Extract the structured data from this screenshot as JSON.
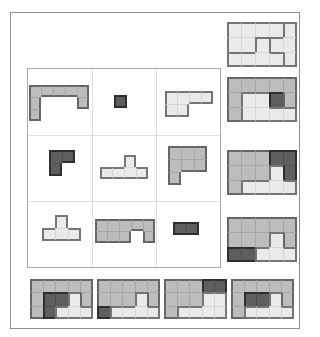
{
  "colors": {
    "page_bg": "#ffffff",
    "frame_border": "#8f8f8f",
    "grid_border": "#aaaaaa",
    "grid_line": "#dedede",
    "piece_colors": {
      "medium": {
        "fill": "#bdbdbd",
        "line": "#a6a6a6",
        "edge": "#666666"
      },
      "light": {
        "fill": "#eaeaea",
        "line": "#d5d5d5",
        "edge": "#757575"
      },
      "dark": {
        "fill": "#5e5e5e",
        "line": "#4e4e4e",
        "edge": "#2e2e2e"
      }
    }
  },
  "frame": {
    "x": 10,
    "y": 12,
    "w": 288,
    "h": 315
  },
  "pieces_grid": {
    "x": 27,
    "y": 68,
    "cols": 3,
    "rows": 3,
    "cell_w": 64,
    "cell_h": 66
  },
  "pieces": [
    {
      "name": "piece-bracket",
      "color": "medium",
      "x": 29,
      "y": 85,
      "cw": 12,
      "ch": 12,
      "map": [
        "aaaaa",
        "a...a",
        "a...."
      ]
    },
    {
      "name": "piece-single-square",
      "color": "dark",
      "x": 114,
      "y": 95,
      "cw": 13,
      "ch": 13,
      "map": [
        "a"
      ]
    },
    {
      "name": "piece-l-hexomino",
      "color": "light",
      "x": 165,
      "y": 91,
      "cw": 12,
      "ch": 13,
      "map": [
        "aaaa",
        "aa.."
      ]
    },
    {
      "name": "piece-l-tromino",
      "color": "dark",
      "x": 49,
      "y": 150,
      "cw": 13,
      "ch": 13,
      "map": [
        "aa",
        "a."
      ]
    },
    {
      "name": "piece-t-pentomino",
      "color": "light",
      "x": 100,
      "y": 155,
      "cw": 12,
      "ch": 12,
      "map": [
        "..a.",
        "aaaa"
      ]
    },
    {
      "name": "piece-p-heptomino",
      "color": "medium",
      "x": 168,
      "y": 146,
      "cw": 13,
      "ch": 13,
      "map": [
        "aaa",
        "aaa",
        "a.."
      ]
    },
    {
      "name": "piece-t-tetromino",
      "color": "light",
      "x": 42,
      "y": 215,
      "cw": 13,
      "ch": 13,
      "map": [
        ".a.",
        "aaa"
      ]
    },
    {
      "name": "piece-u-nonomino",
      "color": "medium",
      "x": 95,
      "y": 219,
      "cw": 12,
      "ch": 12,
      "map": [
        "aaaaa",
        "aaa.a"
      ]
    },
    {
      "name": "piece-domino",
      "color": "dark",
      "x": 173,
      "y": 222,
      "cw": 13,
      "ch": 13,
      "map": [
        "aa"
      ]
    }
  ],
  "options": [
    {
      "name": "option-top-right",
      "x": 227,
      "y": 22,
      "cw": 14,
      "ch": 15,
      "pieces": {
        "a": "light",
        "b": "light",
        "c": "light"
      },
      "map": [
        "aaaac",
        "aabcc",
        "bbbbc"
      ]
    },
    {
      "name": "option-right-1",
      "x": 227,
      "y": 77,
      "cw": 14,
      "ch": 15,
      "pieces": {
        "a": "medium",
        "b": "dark",
        "c": "light"
      },
      "map": [
        "aaaaa",
        "accba",
        "acccc"
      ]
    },
    {
      "name": "option-right-2",
      "x": 227,
      "y": 150,
      "cw": 14,
      "ch": 15,
      "pieces": {
        "a": "medium",
        "b": "dark",
        "c": "light"
      },
      "map": [
        "aaabb",
        "aaacb",
        "acccc"
      ]
    },
    {
      "name": "option-right-3",
      "x": 227,
      "y": 217,
      "cw": 14,
      "ch": 15,
      "pieces": {
        "a": "medium",
        "b": "dark",
        "c": "light"
      },
      "map": [
        "aaaaa",
        "aaaca",
        "bbccc"
      ]
    },
    {
      "name": "option-bottom-1",
      "x": 30,
      "y": 279,
      "cw": 12.6,
      "ch": 13.3,
      "pieces": {
        "a": "medium",
        "b": "dark",
        "c": "light"
      },
      "map": [
        "aaaaa",
        "abbca",
        "abccc"
      ]
    },
    {
      "name": "option-bottom-2",
      "x": 97,
      "y": 279,
      "cw": 12.6,
      "ch": 13.3,
      "pieces": {
        "a": "medium",
        "b": "dark",
        "c": "light"
      },
      "map": [
        "aaaaa",
        "aaaca",
        "bcccc"
      ]
    },
    {
      "name": "option-bottom-3",
      "x": 164,
      "y": 279,
      "cw": 12.6,
      "ch": 13.3,
      "pieces": {
        "a": "medium",
        "b": "dark",
        "c": "light"
      },
      "map": [
        "aaabb",
        "aaacc",
        "acccc"
      ]
    },
    {
      "name": "option-bottom-4",
      "x": 231,
      "y": 279,
      "cw": 12.6,
      "ch": 13.3,
      "pieces": {
        "a": "medium",
        "b": "dark",
        "c": "light"
      },
      "map": [
        "aaaaa",
        "abbca",
        "acccc"
      ]
    }
  ]
}
